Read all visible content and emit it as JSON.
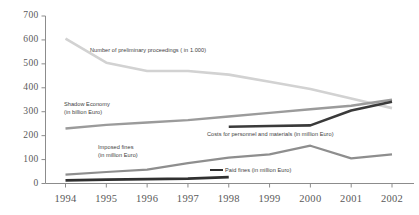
{
  "chart_data": {
    "type": "line",
    "title": "",
    "xlabel": "",
    "ylabel": "",
    "categories": [
      "1994",
      "1995",
      "1996",
      "1997",
      "1998",
      "1999",
      "2000",
      "2001",
      "2002"
    ],
    "x": [
      1994,
      1995,
      1996,
      1997,
      1998,
      1999,
      2000,
      2001,
      2002
    ],
    "ylim": [
      0,
      700
    ],
    "yticks": [
      0,
      100,
      200,
      300,
      400,
      500,
      600,
      700
    ],
    "ytick_labels": [
      "0",
      "100",
      "200",
      "300",
      "400",
      "500",
      "600",
      "700"
    ],
    "grid": false,
    "legend_position": "inline-annotations",
    "series": [
      {
        "name": "Number of preliminary proceedings ( in 1.000)",
        "unit": "1.000",
        "color": "#d2d2d2",
        "x": [
          1994,
          1995,
          1996,
          1997,
          1998,
          1999,
          2000,
          2001,
          2002
        ],
        "values": [
          605,
          505,
          470,
          470,
          455,
          425,
          395,
          355,
          315
        ]
      },
      {
        "name": "Shadow Economy (in billion Euro)",
        "unit": "billion Euro",
        "color": "#9b9b9b",
        "x": [
          1994,
          1995,
          1996,
          1997,
          1998,
          1999,
          2000,
          2001,
          2002
        ],
        "values": [
          230,
          245,
          255,
          265,
          280,
          295,
          310,
          325,
          350
        ]
      },
      {
        "name": "Costs for personnel and materials (in million Euro)",
        "unit": "million Euro",
        "color": "#3a3a3a",
        "x": [
          1998,
          1999,
          2000,
          2001,
          2002
        ],
        "values": [
          237,
          240,
          243,
          305,
          342
        ]
      },
      {
        "name": "Imposed fines (in million Euro)",
        "unit": "million Euro",
        "color": "#8e8e8e",
        "x": [
          1994,
          1995,
          1996,
          1997,
          1998,
          1999,
          2000,
          2001,
          2002
        ],
        "values": [
          37,
          48,
          58,
          85,
          108,
          122,
          158,
          105,
          122
        ]
      },
      {
        "name": "Paid fines (in million Euro)",
        "unit": "million Euro",
        "color": "#303030",
        "x": [
          1994,
          1995,
          1996,
          1997,
          1998
        ],
        "values": [
          13,
          16,
          18,
          20,
          27
        ]
      }
    ],
    "annotations": [
      {
        "key": "proceedings",
        "line1": "Number of preliminary proceedings ( in 1.000)",
        "line2": ""
      },
      {
        "key": "shadow_economy",
        "line1": "Shadow Economy",
        "line2": "(in billion Euro)"
      },
      {
        "key": "costs",
        "line1": "Costs for personnel and materials (in million Euro)",
        "line2": ""
      },
      {
        "key": "imposed_fines",
        "line1": "Imposed fines",
        "line2": "(in million Euro)"
      },
      {
        "key": "paid_fines",
        "line1": "Paid fines (in million Euro)",
        "line2": ""
      }
    ]
  },
  "axis": {
    "y_labels": [
      "700",
      "600",
      "500",
      "400",
      "300",
      "200",
      "100",
      "0"
    ],
    "x_labels": [
      "1994",
      "1995",
      "1996",
      "1997",
      "1998",
      "1999",
      "2000",
      "2001",
      "2002"
    ]
  }
}
